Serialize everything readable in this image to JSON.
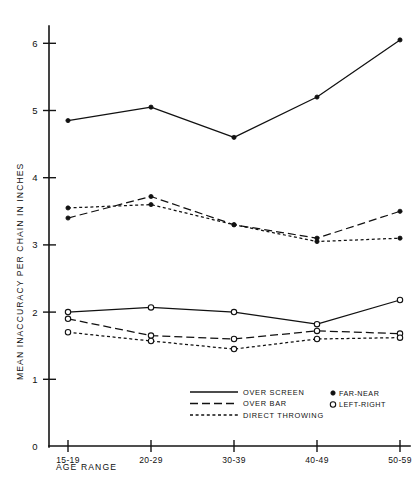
{
  "chart_data": {
    "type": "line",
    "title": "",
    "xlabel": "AGE RANGE",
    "ylabel": "MEAN INACCURACY PER CHAIN IN INCHES",
    "categories": [
      "15-19",
      "20-29",
      "30-39",
      "40-49",
      "50-59"
    ],
    "ylim": [
      0,
      6.5
    ],
    "yticks": [
      0,
      1,
      2,
      3,
      4,
      5,
      6
    ],
    "ytick_labels": [
      "0",
      "1",
      "2",
      "3",
      "4",
      "5",
      "6"
    ],
    "grid": false,
    "legend_position": "bottom-center",
    "series": [
      {
        "name": "Over Screen / Far-Near",
        "condition": "OVER SCREEN",
        "measure": "FAR-NEAR",
        "line_style": "solid",
        "marker": "filled-circle",
        "values": [
          4.85,
          5.05,
          4.6,
          5.2,
          6.05
        ]
      },
      {
        "name": "Over Bar / Far-Near",
        "condition": "OVER BAR",
        "measure": "FAR-NEAR",
        "line_style": "long-dash",
        "marker": "filled-circle",
        "values": [
          3.4,
          3.72,
          3.3,
          3.1,
          3.5
        ]
      },
      {
        "name": "Direct Throwing / Far-Near",
        "condition": "DIRECT THROWING",
        "measure": "FAR-NEAR",
        "line_style": "short-dash",
        "marker": "filled-circle",
        "values": [
          3.55,
          3.6,
          3.3,
          3.05,
          3.1
        ]
      },
      {
        "name": "Over Screen / Left-Right",
        "condition": "OVER SCREEN",
        "measure": "LEFT-RIGHT",
        "line_style": "solid",
        "marker": "open-circle",
        "values": [
          2.0,
          2.07,
          2.0,
          1.82,
          2.18
        ]
      },
      {
        "name": "Over Bar / Left-Right",
        "condition": "OVER BAR",
        "measure": "LEFT-RIGHT",
        "line_style": "long-dash",
        "marker": "open-circle",
        "values": [
          1.9,
          1.65,
          1.6,
          1.72,
          1.68
        ]
      },
      {
        "name": "Direct Throwing / Left-Right",
        "condition": "DIRECT THROWING",
        "measure": "LEFT-RIGHT",
        "line_style": "short-dash",
        "marker": "open-circle",
        "values": [
          1.7,
          1.57,
          1.45,
          1.6,
          1.62
        ]
      }
    ],
    "legend_conditions": [
      {
        "label": "OVER SCREEN",
        "line_style": "solid"
      },
      {
        "label": "OVER BAR",
        "line_style": "long-dash"
      },
      {
        "label": "DIRECT THROWING",
        "line_style": "short-dash"
      }
    ],
    "legend_markers": [
      {
        "label": "FAR-NEAR",
        "marker": "filled-circle"
      },
      {
        "label": "LEFT-RIGHT",
        "marker": "open-circle"
      }
    ]
  }
}
